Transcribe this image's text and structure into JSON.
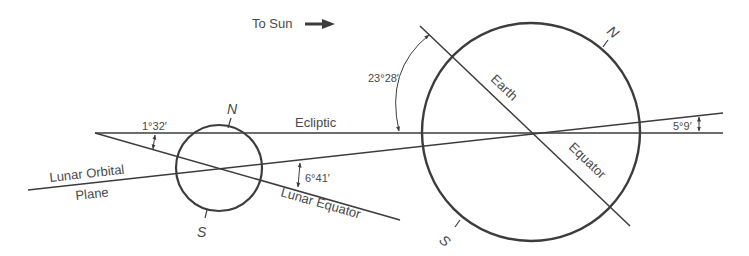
{
  "diagram": {
    "direction": {
      "label": "To Sun",
      "arrow": "right-arrow"
    },
    "lines": {
      "ecliptic": "Ecliptic",
      "lunar_orbital_plane_line1": "Lunar Orbital",
      "lunar_orbital_plane_line2": "Plane",
      "lunar_equator": "Lunar Equator",
      "earth_equator_part1": "Earth",
      "earth_equator_part2": "Equator"
    },
    "angles": {
      "lunar_equator_to_ecliptic": "1°32′",
      "lunar_equator_to_orbit": "6°41′",
      "earth_tilt": "23°28′",
      "orbit_to_ecliptic": "5°9′"
    },
    "poles": {
      "moon_north": "N",
      "moon_south": "S",
      "earth_north": "N",
      "earth_south": "S"
    },
    "bodies": [
      "Moon",
      "Earth"
    ],
    "colors": {
      "ink": "#3c3c3c",
      "text": "#4a4a4a",
      "background": "#ffffff"
    }
  }
}
